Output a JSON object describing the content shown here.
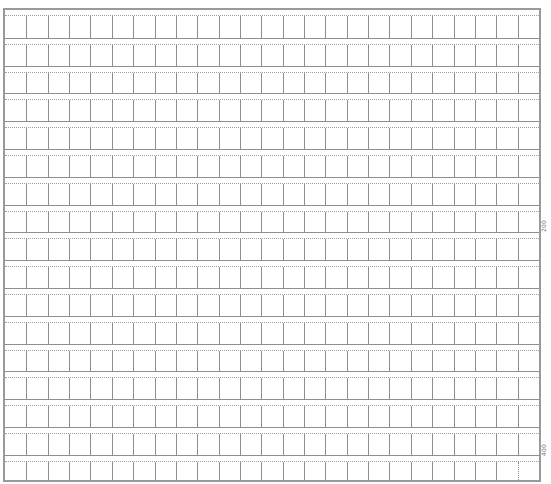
{
  "sheet": {
    "type": "manuscript-grid-paper",
    "columns": 25,
    "rows": 17,
    "line_color": "#8e8e8e",
    "dotted_color": "#a0a0a0"
  },
  "markers": [
    {
      "label": "200",
      "after_row": 8
    },
    {
      "label": "400",
      "after_row": 16
    }
  ]
}
